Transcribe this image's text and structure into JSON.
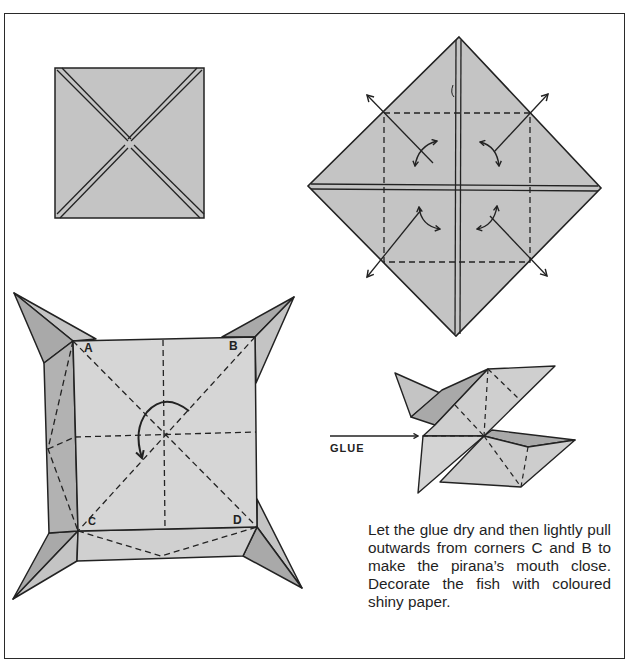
{
  "diagram": {
    "type": "origami-instructions",
    "steps": [
      {
        "id": "step-1",
        "description": "Square with both diagonal creases",
        "fill": "#c4c4c4"
      },
      {
        "id": "step-2",
        "description": "Square folded into diamond with corners folded to center; dashed inner square, outward and rotation arrows at four corners",
        "fill": "#c4c4c4"
      },
      {
        "id": "step-3",
        "description": "Opened box with four pointed corners labeled A, B, C, D; dashed diagonals and center-lines, curved rotation arrow at center",
        "corner_labels": [
          "A",
          "B",
          "C",
          "D"
        ],
        "fill": "#d6d6d6",
        "shade": "#b2b2b2"
      },
      {
        "id": "step-4",
        "description": "Folded fish shape with glue arrow",
        "glue_label": "GLUE"
      }
    ],
    "edges_note": "solid = edges/folded creases, dashed = fold lines"
  },
  "labels": {
    "corner_a": "A",
    "corner_b": "B",
    "corner_c": "C",
    "corner_d": "D",
    "glue": "GLUE"
  },
  "instructions": {
    "text": "Let the glue dry and then lightly pull outwards from corners C and B to make the pirana’s mouth close. Decorate the fish with coloured shiny paper."
  },
  "colors": {
    "paper": "#c4c4c4",
    "paper_light": "#d6d6d6",
    "paper_shade": "#a9a9a9",
    "ink": "#222222",
    "background": "#ffffff"
  }
}
